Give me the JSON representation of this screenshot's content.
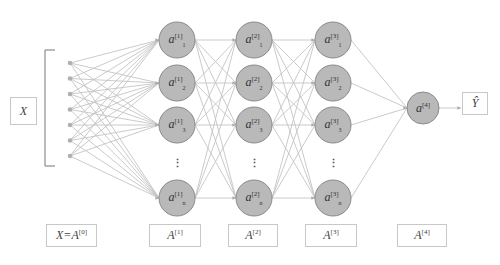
{
  "diagram": {
    "type": "feedforward-neural-network",
    "colors": {
      "node_fill": "#b9b9b9",
      "node_stroke": "#8a8a8a",
      "edge": "#c4c4c4",
      "box_border": "#c8c8c8",
      "text": "#444444"
    },
    "input": {
      "label": "X",
      "dot_count": 7
    },
    "layers": [
      {
        "name": "layer-1",
        "superscript": "[1]",
        "nodes": [
          {
            "symbol": "a",
            "sup": "[1]",
            "sub": "1"
          },
          {
            "symbol": "a",
            "sup": "[1]",
            "sub": "2"
          },
          {
            "symbol": "a",
            "sup": "[1]",
            "sub": "3"
          },
          {
            "symbol": "a",
            "sup": "[1]",
            "sub": "n"
          }
        ],
        "bottom_label": {
          "base": "A",
          "sup": "[1]"
        }
      },
      {
        "name": "layer-2",
        "superscript": "[2]",
        "nodes": [
          {
            "symbol": "a",
            "sup": "[2]",
            "sub": "1"
          },
          {
            "symbol": "a",
            "sup": "[2]",
            "sub": "2"
          },
          {
            "symbol": "a",
            "sup": "[2]",
            "sub": "3"
          },
          {
            "symbol": "a",
            "sup": "[2]",
            "sub": "n"
          }
        ],
        "bottom_label": {
          "base": "A",
          "sup": "[2]"
        }
      },
      {
        "name": "layer-3",
        "superscript": "[3]",
        "nodes": [
          {
            "symbol": "a",
            "sup": "[3]",
            "sub": "1"
          },
          {
            "symbol": "a",
            "sup": "[3]",
            "sub": "2"
          },
          {
            "symbol": "a",
            "sup": "[3]",
            "sub": "3"
          },
          {
            "symbol": "a",
            "sup": "[3]",
            "sub": "n"
          }
        ],
        "bottom_label": {
          "base": "A",
          "sup": "[3]"
        }
      }
    ],
    "output_node": {
      "symbol": "a",
      "sup": "[4]"
    },
    "output_label": "Ŷ",
    "input_bottom_label": {
      "base": "X=A",
      "sup": "[0]"
    },
    "output_bottom_label": {
      "base": "A",
      "sup": "[4]"
    },
    "ellipsis": "⋮"
  }
}
